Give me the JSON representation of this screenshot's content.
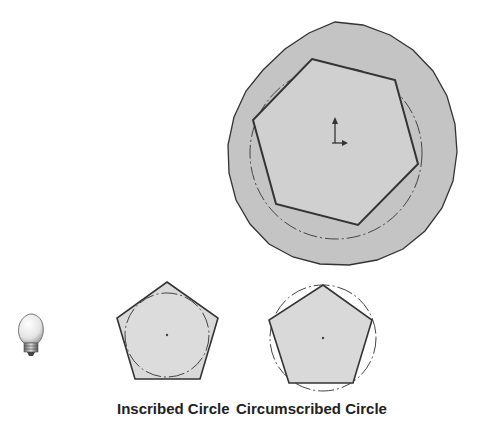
{
  "labels": {
    "inscribed": "Inscribed Circle",
    "circumscribed": "Circumscribed Circle"
  },
  "icons": {
    "tip": "lightbulb-icon",
    "origin": "origin-axes-icon"
  },
  "colors": {
    "disc_fill": "#c4c4c4",
    "polygon_fill": "#d6d6d6",
    "outline": "#333333",
    "construction": "#444444",
    "label_text": "#222222"
  },
  "figures": {
    "main": {
      "shape": "hexagon",
      "sides": 6,
      "construction_circle": "inscribed-in-disc"
    },
    "inscribed_example": {
      "shape": "pentagon",
      "sides": 5,
      "circle": "inscribed"
    },
    "circumscribed_example": {
      "shape": "pentagon",
      "sides": 5,
      "circle": "circumscribed"
    }
  }
}
